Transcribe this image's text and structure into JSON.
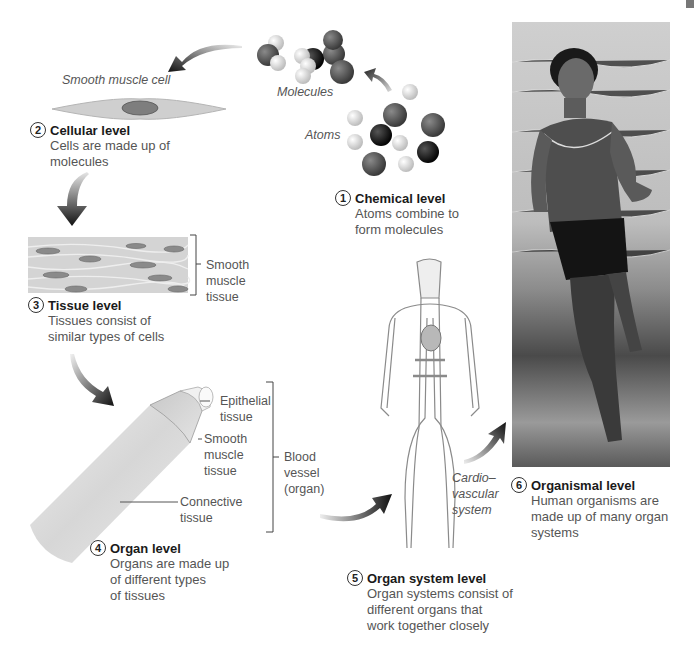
{
  "levels": [
    {
      "number": "1",
      "title": "Chemical level",
      "description_lines": [
        "Atoms combine to",
        "form molecules"
      ]
    },
    {
      "number": "2",
      "title": "Cellular level",
      "description_lines": [
        "Cells are made up of",
        "molecules"
      ]
    },
    {
      "number": "3",
      "title": "Tissue level",
      "description_lines": [
        "Tissues consist of",
        "similar types of cells"
      ]
    },
    {
      "number": "4",
      "title": "Organ level",
      "description_lines": [
        "Organs are made up",
        "of different types",
        "of tissues"
      ]
    },
    {
      "number": "5",
      "title": "Organ system level",
      "description_lines": [
        "Organ systems consist of",
        "different organs that",
        "work together closely"
      ]
    },
    {
      "number": "6",
      "title": "Organismal level",
      "description_lines": [
        "Human organisms are",
        "made up of many organ",
        "systems"
      ]
    }
  ],
  "labels": {
    "atoms": "Atoms",
    "molecules": "Molecules",
    "smooth_muscle_cell": "Smooth muscle cell",
    "smooth_muscle_tissue": [
      "Smooth",
      "muscle",
      "tissue"
    ],
    "epithelial_tissue": [
      "Epithelial",
      "tissue"
    ],
    "smooth_muscle_tissue_organ": [
      "Smooth",
      "muscle",
      "tissue"
    ],
    "connective_tissue": [
      "Connective",
      "tissue"
    ],
    "blood_vessel": [
      "Blood",
      "vessel",
      "(organ)"
    ],
    "cardiovascular_system": [
      "Cardio–",
      "vascular",
      "system"
    ]
  },
  "colors": {
    "text_title": "#1a1a1a",
    "text_body": "#555555",
    "arrow": "#2a2a2a",
    "atom_dark": "#4a4a4a",
    "atom_black": "#111111",
    "atom_light": "#d8d8d8"
  }
}
